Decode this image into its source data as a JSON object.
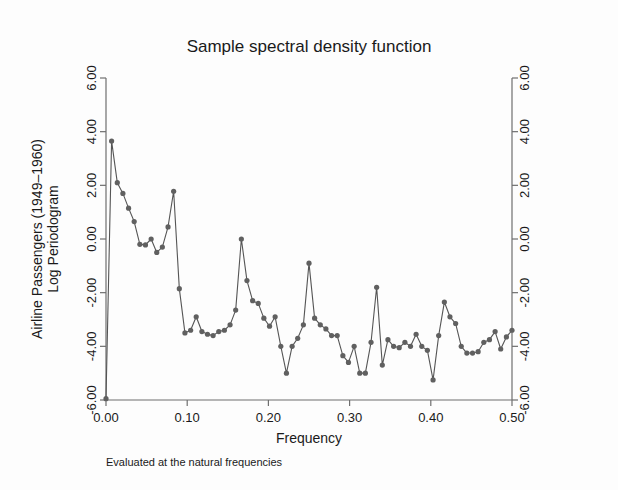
{
  "chart_data": {
    "type": "line",
    "title": "Sample spectral density function",
    "subtitle": "",
    "note": "Evaluated at the natural frequencies",
    "xlabel": "Frequency",
    "ylabel_line1": "Airline Passengers (1949–1960)",
    "ylabel_line2": "Log Periodogram",
    "ylabel_right": "",
    "xlim": [
      0.0,
      0.5
    ],
    "ylim": [
      -6.0,
      6.0
    ],
    "grid": false,
    "legend": "none",
    "marker": "filled-circle",
    "line_color": "#555555",
    "marker_color": "#606060",
    "axis_color": "#6f6f6f",
    "xticks": [
      0.0,
      0.1,
      0.2,
      0.3,
      0.4,
      0.5
    ],
    "xticklabels": [
      "0.00",
      "0.10",
      "0.20",
      "0.30",
      "0.40",
      "0.50"
    ],
    "yticks": [
      -6.0,
      -4.0,
      -2.0,
      0.0,
      2.0,
      4.0,
      6.0
    ],
    "yticklabels": [
      "-6.00",
      "-4.00",
      "-2.00",
      "0.00",
      "2.00",
      "4.00",
      "6.00"
    ],
    "yticklabels_right": [
      "-6.00",
      "-4.00",
      "-2.00",
      "0.00",
      "2.00",
      "4.00",
      "6.00"
    ],
    "series": [
      {
        "name": "Log Periodogram",
        "x": [
          0.0,
          0.0069,
          0.0139,
          0.0208,
          0.0278,
          0.0347,
          0.0417,
          0.0486,
          0.0556,
          0.0625,
          0.0694,
          0.0764,
          0.0833,
          0.0903,
          0.0972,
          0.1042,
          0.1111,
          0.1181,
          0.125,
          0.1319,
          0.1389,
          0.1458,
          0.1528,
          0.1597,
          0.1667,
          0.1736,
          0.1806,
          0.1875,
          0.1944,
          0.2014,
          0.2083,
          0.2153,
          0.2222,
          0.2292,
          0.2361,
          0.2431,
          0.25,
          0.2569,
          0.2639,
          0.2708,
          0.2778,
          0.2847,
          0.2917,
          0.2986,
          0.3056,
          0.3125,
          0.3194,
          0.3264,
          0.3333,
          0.3403,
          0.3472,
          0.3542,
          0.3611,
          0.3681,
          0.375,
          0.3819,
          0.3889,
          0.3958,
          0.4028,
          0.4097,
          0.4167,
          0.4236,
          0.4306,
          0.4375,
          0.4444,
          0.4514,
          0.4583,
          0.4653,
          0.4722,
          0.4792,
          0.4861,
          0.4931,
          0.5
        ],
        "y": [
          -5.95,
          3.65,
          2.1,
          1.7,
          1.15,
          0.65,
          -0.2,
          -0.22,
          0.0,
          -0.5,
          -0.3,
          0.45,
          1.78,
          -1.85,
          -3.5,
          -3.4,
          -2.9,
          -3.45,
          -3.55,
          -3.6,
          -3.45,
          -3.4,
          -3.2,
          -2.65,
          0.0,
          -1.55,
          -2.3,
          -2.4,
          -2.95,
          -3.25,
          -2.9,
          -4.0,
          -5.0,
          -4.0,
          -3.7,
          -3.2,
          -0.9,
          -2.95,
          -3.2,
          -3.35,
          -3.6,
          -3.6,
          -4.35,
          -4.6,
          -4.0,
          -5.0,
          -5.0,
          -3.85,
          -1.8,
          -4.7,
          -3.75,
          -4.0,
          -4.05,
          -3.85,
          -4.0,
          -3.55,
          -4.0,
          -4.15,
          -5.25,
          -3.6,
          -2.35,
          -2.9,
          -3.15,
          -4.0,
          -4.25,
          -4.25,
          -4.2,
          -3.85,
          -3.75,
          -3.45,
          -4.1,
          -3.65,
          -3.4
        ]
      }
    ]
  }
}
